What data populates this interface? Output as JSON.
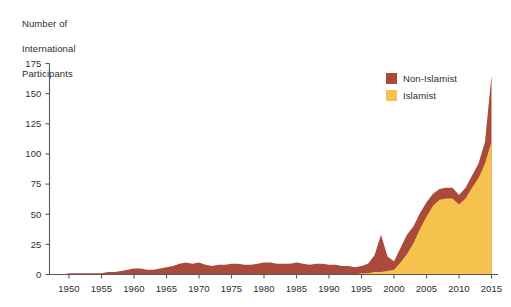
{
  "chart_data": {
    "type": "area",
    "title": "",
    "subtitle": "",
    "ylabel": "Number of\nInternational\nParticipants",
    "xlabel": "",
    "stacked": true,
    "grid": false,
    "legend_position": "top-right",
    "xlim": [
      1947,
      2016
    ],
    "ylim": [
      0,
      175
    ],
    "yticks": [
      0,
      25,
      50,
      75,
      100,
      125,
      150,
      175
    ],
    "ytick_labels": [
      "0",
      "25",
      "50",
      "75",
      "100",
      "125",
      "150",
      "175"
    ],
    "xticks": [
      1950,
      1955,
      1960,
      1965,
      1970,
      1975,
      1980,
      1985,
      1990,
      1995,
      2000,
      2005,
      2010,
      2015
    ],
    "xtick_labels": [
      "1950",
      "1955",
      "1960",
      "1965",
      "1970",
      "1975",
      "1980",
      "1985",
      "1990",
      "1995",
      "2000",
      "2005",
      "2010",
      "2015"
    ],
    "colors": {
      "non_islamist": "#A94A3B",
      "islamist": "#F5C34D",
      "axis": "#58585A",
      "text": "#2E2E2E",
      "background": "#FFFFFF"
    },
    "x": [
      1947,
      1948,
      1949,
      1950,
      1951,
      1952,
      1953,
      1954,
      1955,
      1956,
      1957,
      1958,
      1959,
      1960,
      1961,
      1962,
      1963,
      1964,
      1965,
      1966,
      1967,
      1968,
      1969,
      1970,
      1971,
      1972,
      1973,
      1974,
      1975,
      1976,
      1977,
      1978,
      1979,
      1980,
      1981,
      1982,
      1983,
      1984,
      1985,
      1986,
      1987,
      1988,
      1989,
      1990,
      1991,
      1992,
      1993,
      1994,
      1995,
      1996,
      1997,
      1998,
      1999,
      2000,
      2001,
      2002,
      2003,
      2004,
      2005,
      2006,
      2007,
      2008,
      2009,
      2010,
      2011,
      2012,
      2013,
      2014,
      2015
    ],
    "series": [
      {
        "name": "Islamist",
        "color": "#F5C34D",
        "values": [
          0,
          0,
          0,
          0,
          0,
          0,
          0,
          0,
          0,
          0,
          0,
          0,
          0,
          0,
          0,
          0,
          0,
          0,
          0,
          0,
          0,
          0,
          0,
          0,
          0,
          0,
          0,
          0,
          0,
          0,
          0,
          0,
          0,
          0,
          0,
          0,
          0,
          0,
          0,
          0,
          0,
          0,
          0,
          0,
          0,
          0,
          0,
          0,
          1,
          1,
          2,
          2,
          3,
          4,
          10,
          17,
          26,
          38,
          48,
          57,
          62,
          63,
          63,
          58,
          63,
          72,
          80,
          92,
          110
        ]
      },
      {
        "name": "Non-Islamist",
        "color": "#A94A3B",
        "values": [
          0,
          0,
          0,
          1,
          1,
          1,
          1,
          1,
          1,
          2,
          2,
          3,
          4,
          5,
          5,
          4,
          4,
          5,
          6,
          7,
          9,
          10,
          9,
          10,
          8,
          7,
          8,
          8,
          9,
          9,
          8,
          8,
          9,
          10,
          10,
          9,
          9,
          9,
          10,
          9,
          8,
          9,
          9,
          8,
          8,
          7,
          7,
          6,
          6,
          8,
          14,
          31,
          12,
          7,
          12,
          16,
          14,
          13,
          12,
          10,
          9,
          9,
          9,
          8,
          9,
          10,
          12,
          18,
          55
        ]
      }
    ]
  },
  "legend": {
    "items": [
      {
        "label": "Non-Islamist",
        "color": "#A94A3B"
      },
      {
        "label": "Islamist",
        "color": "#F5C34D"
      }
    ]
  },
  "axis_title": {
    "line1": "Number of",
    "line2": "International",
    "line3": "Participants"
  }
}
